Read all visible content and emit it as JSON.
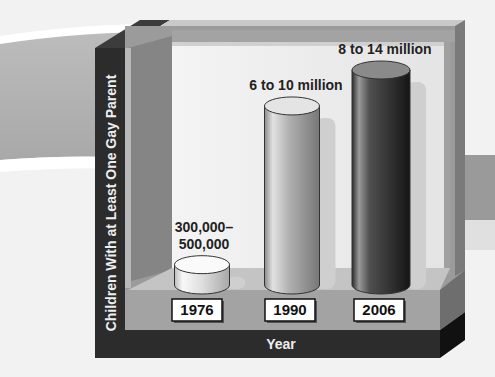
{
  "chart_data": {
    "type": "bar",
    "style": "3d-cylinder",
    "title": "",
    "xlabel": "Year",
    "ylabel": "Children With at Least One Gay Parent",
    "categories": [
      "1976",
      "1990",
      "2006"
    ],
    "values_low": [
      300000,
      6000000,
      8000000
    ],
    "values_high": [
      500000,
      10000000,
      14000000
    ],
    "data_labels": [
      [
        "300,000–",
        "500,000"
      ],
      [
        "6 to 10 million"
      ],
      [
        "8 to 14 million"
      ]
    ],
    "bar_colors": [
      "#e6e6e6",
      "#a9a9a9",
      "#3a3a3a"
    ],
    "legend": "none",
    "grid": false
  }
}
